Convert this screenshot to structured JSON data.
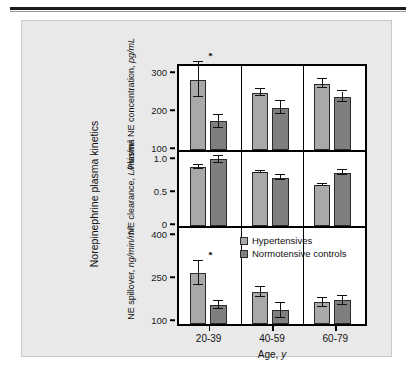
{
  "figure": {
    "outer_label": "Norepinephrine plasma kinetics",
    "x_title_main": "Age,",
    "x_title_unit": "y"
  },
  "legend": {
    "items": [
      {
        "label": "Hypertensives",
        "color": "#a9a9a9"
      },
      {
        "label": "Normotensive controls",
        "color": "#7f7f7f"
      }
    ]
  },
  "chart_data": [
    {
      "type": "bar",
      "panel": "top",
      "title": "",
      "ylabel_line1": "Plasma NE",
      "ylabel_line2": "concentration,",
      "ylabel_unit": "pg/mL",
      "xlabel": "Age, y",
      "categories": [
        "20-39",
        "40-59",
        "60-79"
      ],
      "ylim": [
        100,
        340
      ],
      "yticks": [
        100,
        200,
        300
      ],
      "ytick_labels": [
        "100",
        "200",
        "300"
      ],
      "grid": false,
      "legend_position": "none",
      "series": [
        {
          "name": "Hypertensives",
          "color": "#a9a9a9",
          "values": [
            285,
            251,
            275
          ],
          "errors": [
            46,
            10,
            13
          ]
        },
        {
          "name": "Normotensive controls",
          "color": "#7f7f7f",
          "values": [
            176,
            211,
            240
          ],
          "errors": [
            17,
            17,
            14
          ]
        }
      ],
      "annotations": [
        {
          "text": "*",
          "category": "20-39",
          "series": "Hypertensives"
        }
      ]
    },
    {
      "type": "bar",
      "panel": "middle",
      "title": "",
      "ylabel_line1": "NE clearance,",
      "ylabel_unit": "L/min/m²",
      "xlabel": "Age, y",
      "categories": [
        "20-39",
        "40-59",
        "60-79"
      ],
      "ylim": [
        0,
        1.15
      ],
      "yticks": [
        0,
        0.5,
        1.0
      ],
      "ytick_labels": [
        "0",
        "0.5",
        "1.0"
      ],
      "grid": false,
      "legend_position": "none",
      "series": [
        {
          "name": "Hypertensives",
          "color": "#a9a9a9",
          "values": [
            0.89,
            0.82,
            0.62
          ],
          "errors": [
            0.03,
            0.02,
            0.02
          ]
        },
        {
          "name": "Normotensive controls",
          "color": "#7f7f7f",
          "values": [
            1.01,
            0.73,
            0.81
          ],
          "errors": [
            0.05,
            0.04,
            0.04
          ]
        }
      ],
      "annotations": []
    },
    {
      "type": "bar",
      "panel": "bottom",
      "title": "",
      "ylabel_line1": "NE spillover,",
      "ylabel_unit": "ng/min/m²",
      "xlabel": "Age, y",
      "categories": [
        "20-39",
        "40-59",
        "60-79"
      ],
      "ylim": [
        100,
        415
      ],
      "yticks": [
        100,
        250,
        400
      ],
      "ytick_labels": [
        "100",
        "250",
        "400"
      ],
      "grid": false,
      "legend_position": "top-right",
      "series": [
        {
          "name": "Hypertensives",
          "color": "#a9a9a9",
          "values": [
            278,
            212,
            176
          ],
          "errors": [
            41,
            18,
            15
          ]
        },
        {
          "name": "Normotensive controls",
          "color": "#7f7f7f",
          "values": [
            168,
            148,
            183
          ],
          "errors": [
            14,
            26,
            15
          ]
        }
      ],
      "annotations": [
        {
          "text": "*",
          "category": "20-39",
          "series": "Hypertensives"
        }
      ]
    }
  ]
}
